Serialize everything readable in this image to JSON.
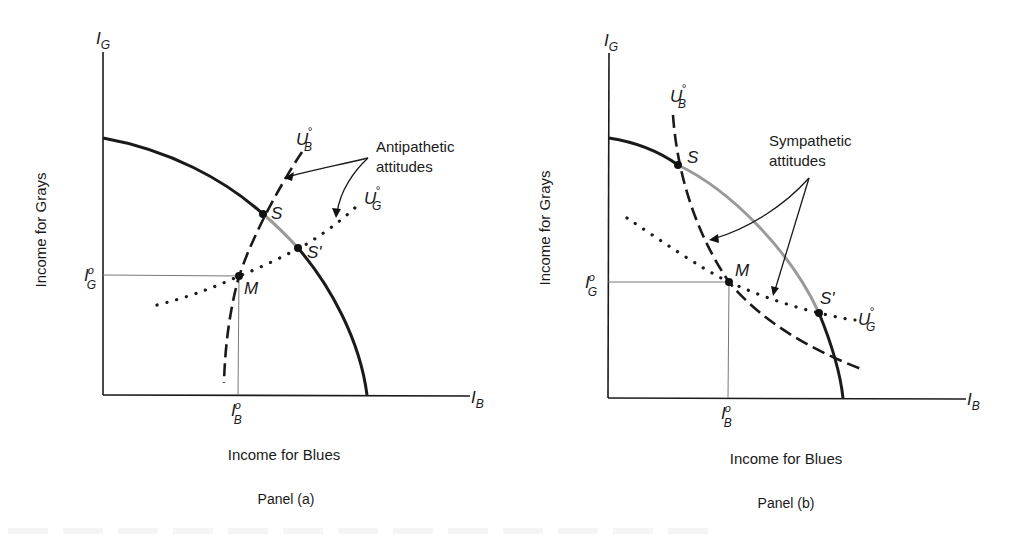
{
  "figure": {
    "panels": [
      {
        "id": "a",
        "caption": "Panel (a)",
        "x_axis_label": "Income for Blues",
        "y_axis_label": "Income for Grays",
        "x_axis_symbol": "I",
        "x_axis_symbol_sub": "B",
        "y_axis_symbol": "I",
        "y_axis_symbol_sub": "G",
        "x_tick": {
          "base": "I",
          "sup": "o",
          "sub": "B"
        },
        "y_tick": {
          "base": "I",
          "sup": "o",
          "sub": "G"
        },
        "annotation": {
          "line1": "Antipathetic",
          "line2": "attitudes"
        },
        "curves": {
          "ub": {
            "base": "U",
            "sup": "°",
            "sub": "B",
            "style": "dashed"
          },
          "ug": {
            "base": "U",
            "sup": "°",
            "sub": "G",
            "style": "dotted"
          },
          "frontier": {
            "style": "solid",
            "gray_segment": "S to S'"
          }
        },
        "points": {
          "S": "S",
          "S_prime": "S'",
          "M": "M"
        }
      },
      {
        "id": "b",
        "caption": "Panel (b)",
        "x_axis_label": "Income for Blues",
        "y_axis_label": "Income for Grays",
        "x_axis_symbol": "I",
        "x_axis_symbol_sub": "B",
        "y_axis_symbol": "I",
        "y_axis_symbol_sub": "G",
        "x_tick": {
          "base": "I",
          "sup": "o",
          "sub": "B"
        },
        "y_tick": {
          "base": "I",
          "sup": "o",
          "sub": "G"
        },
        "annotation": {
          "line1": "Sympathetic",
          "line2": "attitudes"
        },
        "curves": {
          "ub": {
            "base": "U",
            "sup": "°",
            "sub": "B",
            "style": "dashed"
          },
          "ug": {
            "base": "U",
            "sup": "°",
            "sub": "G",
            "style": "dotted"
          },
          "frontier": {
            "style": "solid",
            "gray_segment": "S to S'"
          }
        },
        "points": {
          "S": "S",
          "S_prime": "S'",
          "M": "M"
        }
      }
    ],
    "colors": {
      "ink": "#1a1a1a",
      "gray_segment": "#9a9a9a",
      "guide": "#777777"
    }
  }
}
